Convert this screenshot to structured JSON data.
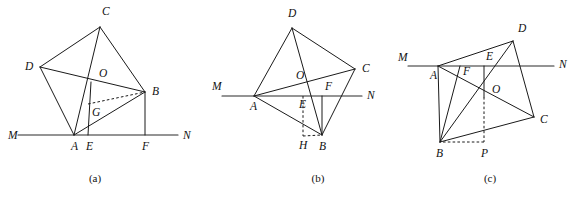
{
  "page": {
    "background_color": "#ffffff",
    "stroke_color": "#1a1a1a",
    "width": 577,
    "height": 198
  },
  "figures": [
    {
      "id": "figure-a",
      "caption": "(a)",
      "caption_pos": {
        "x": 95,
        "y": 182
      },
      "points": {
        "A": {
          "x": 74,
          "y": 135
        },
        "B": {
          "x": 145,
          "y": 92
        },
        "C": {
          "x": 100,
          "y": 27
        },
        "D": {
          "x": 40,
          "y": 67
        },
        "E": {
          "x": 88,
          "y": 135
        },
        "F": {
          "x": 145,
          "y": 135
        },
        "G": {
          "x": 88,
          "y": 104
        },
        "O": {
          "x": 91,
          "y": 82
        },
        "M": {
          "x": 18,
          "y": 135
        },
        "N": {
          "x": 178,
          "y": 135
        }
      },
      "labels": [
        {
          "text": "C",
          "x": 102,
          "y": 15,
          "name": "vertex-label-c"
        },
        {
          "text": "D",
          "x": 25,
          "y": 70,
          "name": "vertex-label-d"
        },
        {
          "text": "O",
          "x": 99,
          "y": 77,
          "name": "vertex-label-o"
        },
        {
          "text": "B",
          "x": 152,
          "y": 95,
          "name": "vertex-label-b"
        },
        {
          "text": "G",
          "x": 92,
          "y": 116,
          "name": "vertex-label-g"
        },
        {
          "text": "M",
          "x": 8,
          "y": 139,
          "name": "vertex-label-m"
        },
        {
          "text": "N",
          "x": 183,
          "y": 139,
          "name": "vertex-label-n"
        },
        {
          "text": "A",
          "x": 71,
          "y": 150,
          "name": "vertex-label-a"
        },
        {
          "text": "E",
          "x": 86,
          "y": 150,
          "name": "vertex-label-e"
        },
        {
          "text": "F",
          "x": 142,
          "y": 150,
          "name": "vertex-label-f"
        }
      ],
      "segments": [
        {
          "from": "A",
          "to": "C",
          "name": "segment-ac"
        },
        {
          "from": "C",
          "to": "B",
          "name": "segment-cb"
        },
        {
          "from": "C",
          "to": "D",
          "name": "segment-cd"
        },
        {
          "from": "D",
          "to": "A",
          "name": "segment-da"
        },
        {
          "from": "D",
          "to": "B",
          "name": "segment-db"
        },
        {
          "from": "A",
          "to": "B",
          "name": "segment-ab"
        },
        {
          "from": "E",
          "to": "O",
          "name": "segment-eo"
        },
        {
          "from": "B",
          "to": "F",
          "name": "segment-bf"
        }
      ],
      "dashed_segments": [
        {
          "from": "G",
          "to": "B",
          "name": "segment-gb-dashed"
        }
      ],
      "axis": {
        "from": "M",
        "to": "N",
        "name": "line-mn"
      }
    },
    {
      "id": "figure-b",
      "caption": "(b)",
      "caption_pos": {
        "x": 318,
        "y": 182
      },
      "points": {
        "A": {
          "x": 254,
          "y": 96
        },
        "B": {
          "x": 322,
          "y": 135
        },
        "C": {
          "x": 355,
          "y": 69
        },
        "D": {
          "x": 292,
          "y": 28
        },
        "E": {
          "x": 303,
          "y": 96
        },
        "F": {
          "x": 322,
          "y": 96
        },
        "H": {
          "x": 303,
          "y": 136
        },
        "O": {
          "x": 306,
          "y": 79
        },
        "M": {
          "x": 222,
          "y": 96
        },
        "N": {
          "x": 362,
          "y": 96
        }
      },
      "labels": [
        {
          "text": "D",
          "x": 288,
          "y": 17,
          "name": "vertex-label-d"
        },
        {
          "text": "C",
          "x": 362,
          "y": 72,
          "name": "vertex-label-c"
        },
        {
          "text": "O",
          "x": 296,
          "y": 79,
          "name": "vertex-label-o"
        },
        {
          "text": "F",
          "x": 325,
          "y": 90,
          "name": "vertex-label-f"
        },
        {
          "text": "M",
          "x": 212,
          "y": 90,
          "name": "vertex-label-m"
        },
        {
          "text": "N",
          "x": 367,
          "y": 99,
          "name": "vertex-label-n"
        },
        {
          "text": "A",
          "x": 250,
          "y": 110,
          "name": "vertex-label-a"
        },
        {
          "text": "E",
          "x": 299,
          "y": 108,
          "name": "vertex-label-e"
        },
        {
          "text": "H",
          "x": 299,
          "y": 149,
          "name": "vertex-label-h"
        },
        {
          "text": "B",
          "x": 319,
          "y": 150,
          "name": "vertex-label-b"
        }
      ],
      "segments": [
        {
          "from": "A",
          "to": "D",
          "name": "segment-ad"
        },
        {
          "from": "D",
          "to": "C",
          "name": "segment-dc"
        },
        {
          "from": "C",
          "to": "B",
          "name": "segment-cb"
        },
        {
          "from": "B",
          "to": "A",
          "name": "segment-ba"
        },
        {
          "from": "A",
          "to": "C",
          "name": "segment-ac"
        },
        {
          "from": "D",
          "to": "B",
          "name": "segment-db"
        },
        {
          "from": "F",
          "to": "B",
          "name": "segment-fb"
        }
      ],
      "dashed_segments": [
        {
          "from": "E",
          "to": "H",
          "name": "segment-eh-dashed"
        },
        {
          "from": "H",
          "to": "B",
          "name": "segment-hb-dashed"
        }
      ],
      "axis": {
        "from": "M",
        "to": "N",
        "name": "line-mn"
      }
    },
    {
      "id": "figure-c",
      "caption": "(c)",
      "caption_pos": {
        "x": 490,
        "y": 182
      },
      "points": {
        "A": {
          "x": 438,
          "y": 66
        },
        "B": {
          "x": 440,
          "y": 142
        },
        "C": {
          "x": 534,
          "y": 117
        },
        "D": {
          "x": 513,
          "y": 41
        },
        "E": {
          "x": 484,
          "y": 66
        },
        "F": {
          "x": 460,
          "y": 66
        },
        "O": {
          "x": 484,
          "y": 97
        },
        "P": {
          "x": 484,
          "y": 142
        },
        "M": {
          "x": 408,
          "y": 66
        },
        "N": {
          "x": 554,
          "y": 66
        }
      },
      "labels": [
        {
          "text": "D",
          "x": 518,
          "y": 32,
          "name": "vertex-label-d"
        },
        {
          "text": "M",
          "x": 398,
          "y": 61,
          "name": "vertex-label-m"
        },
        {
          "text": "E",
          "x": 486,
          "y": 60,
          "name": "vertex-label-e"
        },
        {
          "text": "N",
          "x": 559,
          "y": 68,
          "name": "vertex-label-n"
        },
        {
          "text": "A",
          "x": 430,
          "y": 79,
          "name": "vertex-label-a"
        },
        {
          "text": "F",
          "x": 463,
          "y": 75,
          "name": "vertex-label-f"
        },
        {
          "text": "O",
          "x": 492,
          "y": 93,
          "name": "vertex-label-o"
        },
        {
          "text": "C",
          "x": 540,
          "y": 123,
          "name": "vertex-label-c"
        },
        {
          "text": "B",
          "x": 436,
          "y": 157,
          "name": "vertex-label-b"
        },
        {
          "text": "P",
          "x": 481,
          "y": 157,
          "name": "vertex-label-p"
        }
      ],
      "segments": [
        {
          "from": "A",
          "to": "D",
          "name": "segment-ad"
        },
        {
          "from": "D",
          "to": "C",
          "name": "segment-dc"
        },
        {
          "from": "C",
          "to": "B",
          "name": "segment-cb"
        },
        {
          "from": "B",
          "to": "A",
          "name": "segment-ba"
        },
        {
          "from": "A",
          "to": "C",
          "name": "segment-ac"
        },
        {
          "from": "D",
          "to": "B",
          "name": "segment-db"
        },
        {
          "from": "F",
          "to": "B",
          "name": "segment-fb"
        },
        {
          "from": "E",
          "to": "O",
          "name": "segment-eo"
        }
      ],
      "dashed_segments": [
        {
          "from": "O",
          "to": "P",
          "name": "segment-op-dashed"
        },
        {
          "from": "P",
          "to": "B",
          "name": "segment-pb-dashed"
        }
      ],
      "axis": {
        "from": "M",
        "to": "N",
        "name": "line-mn"
      }
    }
  ]
}
